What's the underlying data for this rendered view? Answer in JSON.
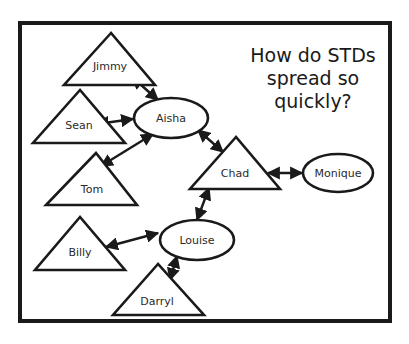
{
  "title": {
    "lines": [
      "How do STDs",
      "spread so",
      "quickly?"
    ]
  },
  "legend_semantics": {
    "triangle": "male",
    "ellipse": "female"
  },
  "nodes": [
    {
      "id": "jimmy",
      "label": "Jimmy",
      "shape": "triangle"
    },
    {
      "id": "sean",
      "label": "Sean",
      "shape": "triangle"
    },
    {
      "id": "aisha",
      "label": "Aisha",
      "shape": "ellipse"
    },
    {
      "id": "tom",
      "label": "Tom",
      "shape": "triangle"
    },
    {
      "id": "chad",
      "label": "Chad",
      "shape": "triangle"
    },
    {
      "id": "monique",
      "label": "Monique",
      "shape": "ellipse"
    },
    {
      "id": "louise",
      "label": "Louise",
      "shape": "ellipse"
    },
    {
      "id": "billy",
      "label": "Billy",
      "shape": "triangle"
    },
    {
      "id": "darryl",
      "label": "Darryl",
      "shape": "triangle"
    }
  ],
  "edges": [
    {
      "from": "jimmy",
      "to": "aisha",
      "type": "bidirectional"
    },
    {
      "from": "sean",
      "to": "aisha",
      "type": "bidirectional"
    },
    {
      "from": "tom",
      "to": "aisha",
      "type": "bidirectional"
    },
    {
      "from": "aisha",
      "to": "chad",
      "type": "bidirectional"
    },
    {
      "from": "chad",
      "to": "monique",
      "type": "bidirectional"
    },
    {
      "from": "chad",
      "to": "louise",
      "type": "bidirectional"
    },
    {
      "from": "billy",
      "to": "louise",
      "type": "bidirectional"
    },
    {
      "from": "darryl",
      "to": "louise",
      "type": "bidirectional"
    }
  ],
  "colors": {
    "stroke": "#1a1a1a",
    "background": "#ffffff",
    "text": "#2a2a2a"
  }
}
